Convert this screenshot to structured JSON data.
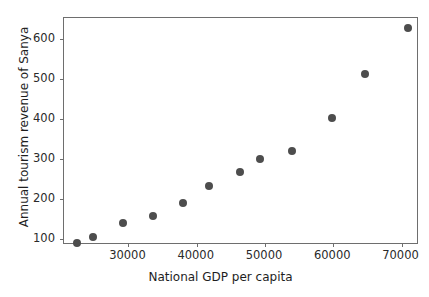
{
  "chart_data": {
    "type": "scatter",
    "title": "",
    "xlabel": "National GDP per capita",
    "ylabel": "Annual tourism revenue of Sanya",
    "xlim": [
      20560,
      72560
    ],
    "ylim": [
      85,
      652
    ],
    "xticks": [
      30000,
      40000,
      50000,
      60000,
      70000
    ],
    "xtick_labels": [
      "30000",
      "40000",
      "50000",
      "60000",
      "70000"
    ],
    "yticks": [
      100,
      200,
      300,
      400,
      500,
      600
    ],
    "ytick_labels": [
      "100",
      "200",
      "300",
      "400",
      "500",
      "600"
    ],
    "grid": false,
    "legend": null,
    "marker": {
      "shape": "circle",
      "color": "#4d4d4d",
      "size_px": 8
    },
    "series": [
      {
        "name": "Sanya tourism revenue vs national GDP per capita",
        "x": [
          22400,
          24800,
          29150,
          33650,
          38000,
          41800,
          46400,
          49300,
          53900,
          59800,
          64700,
          71000
        ],
        "y": [
          91,
          104,
          140,
          157,
          190,
          232,
          267,
          301,
          319,
          403,
          512,
          627
        ]
      }
    ],
    "points": [
      {
        "x": 22400,
        "y": 91
      },
      {
        "x": 24800,
        "y": 104
      },
      {
        "x": 29150,
        "y": 140
      },
      {
        "x": 33650,
        "y": 157
      },
      {
        "x": 38000,
        "y": 190
      },
      {
        "x": 41800,
        "y": 232
      },
      {
        "x": 46400,
        "y": 267
      },
      {
        "x": 49300,
        "y": 301
      },
      {
        "x": 53900,
        "y": 319
      },
      {
        "x": 59800,
        "y": 403
      },
      {
        "x": 64700,
        "y": 512
      },
      {
        "x": 71000,
        "y": 627
      }
    ]
  },
  "figure": {
    "background_color": "#ffffff",
    "axes_color": "#6e6e6e",
    "text_color": "#1e1e1e"
  }
}
